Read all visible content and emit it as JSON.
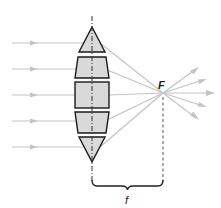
{
  "diagram": {
    "focal_point_label": "F",
    "focal_length_label": "f",
    "colors": {
      "ray": "#c4c4c4",
      "lens_fill": "#d9d9d9",
      "lens_stroke": "#1a1a1a",
      "axis": "#333333",
      "label": "#222222"
    },
    "incident_rays": [
      {
        "y": 43
      },
      {
        "y": 69
      },
      {
        "y": 95
      },
      {
        "y": 121
      },
      {
        "y": 147
      }
    ],
    "lens_segments": [
      {
        "shape": "triangle",
        "position": "top"
      },
      {
        "shape": "trapezoid",
        "position": "upper"
      },
      {
        "shape": "rectangle",
        "position": "center"
      },
      {
        "shape": "trapezoid",
        "position": "lower"
      },
      {
        "shape": "triangle",
        "position": "bottom"
      }
    ]
  }
}
